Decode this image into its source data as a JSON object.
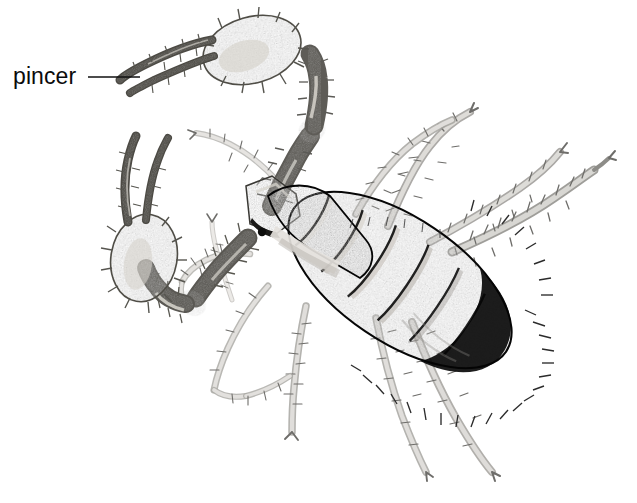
{
  "figure": {
    "view": "dorsal",
    "style": "black-and-white stipple / pen-and-ink scientific illustration",
    "background_color": "#ffffff",
    "width": 637,
    "height": 503
  },
  "annotations": [
    {
      "id": "pincer",
      "label": "pincer",
      "text_color": "#0b0b0b",
      "text_x": 13,
      "text_y": 63,
      "font_size_px": 23,
      "leader_line": {
        "color": "#111111",
        "width_px": 1.6,
        "x1": 88,
        "y1": 77,
        "x2": 140,
        "y2": 77
      }
    }
  ],
  "palette": {
    "body_dark": "#141414",
    "body_darkest": "#070707",
    "body_band_light": "#e6e4e0",
    "body_mid": "#3a3a3a",
    "carapace": "#585858",
    "pedipalp_gray": "#8a8a88",
    "pedipalp_shadow": "#5e5e5c",
    "pedipalp_highlight": "#d9d7d2",
    "leg_gray": "#c3c2bf",
    "leg_outline": "#6f6e6b",
    "bristle": "#6b6a67",
    "white": "#ffffff"
  },
  "anatomy": {
    "pincers": [
      {
        "name": "upper-pincer",
        "position": "top-center",
        "orientation": "fingers point left",
        "labeled": true
      },
      {
        "name": "lower-pincer",
        "position": "mid-left",
        "orientation": "fingers point up-left",
        "labeled": false
      }
    ],
    "abdomen": {
      "name": "opisthosoma",
      "segments": 8,
      "description": "dark ovoid banded abdomen with pale intersegmental bands and radiating marginal bristles"
    },
    "carapace": {
      "name": "cephalothorax",
      "description": "light gray plate at anterior end"
    },
    "legs": {
      "count": 8,
      "description": "slender pale gray walking legs with spine-like setae"
    }
  }
}
